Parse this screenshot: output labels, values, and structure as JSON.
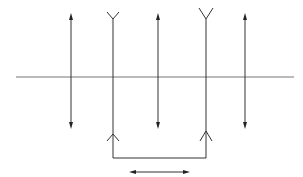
{
  "diagram": {
    "type": "optical-system-schematic",
    "colors": {
      "line": "#333333",
      "axis": "#777777",
      "background": "#ffffff"
    },
    "optical_axis": {
      "y": 77,
      "x_start": 16,
      "x_end": 294
    },
    "elements": [
      {
        "id": "lens-1",
        "kind": "converging-lens",
        "x": 71,
        "y_top": 14,
        "y_bottom": 128
      },
      {
        "id": "element-2",
        "kind": "diverging-lens-coupled",
        "x": 113,
        "y_top": 14,
        "y_bottom": 158
      },
      {
        "id": "lens-3",
        "kind": "converging-lens",
        "x": 158,
        "y_top": 14,
        "y_bottom": 128
      },
      {
        "id": "element-4",
        "kind": "diverging-lens-coupled",
        "x": 206,
        "y_top": 14,
        "y_bottom": 158
      },
      {
        "id": "lens-5",
        "kind": "converging-lens",
        "x": 245,
        "y_top": 14,
        "y_bottom": 128
      }
    ],
    "coupling_bracket": {
      "y": 158,
      "x_start": 113,
      "x_end": 206
    },
    "translation_arrow": {
      "y": 172,
      "x_start": 131,
      "x_end": 188,
      "meaning": "bidirectional-movement"
    }
  }
}
